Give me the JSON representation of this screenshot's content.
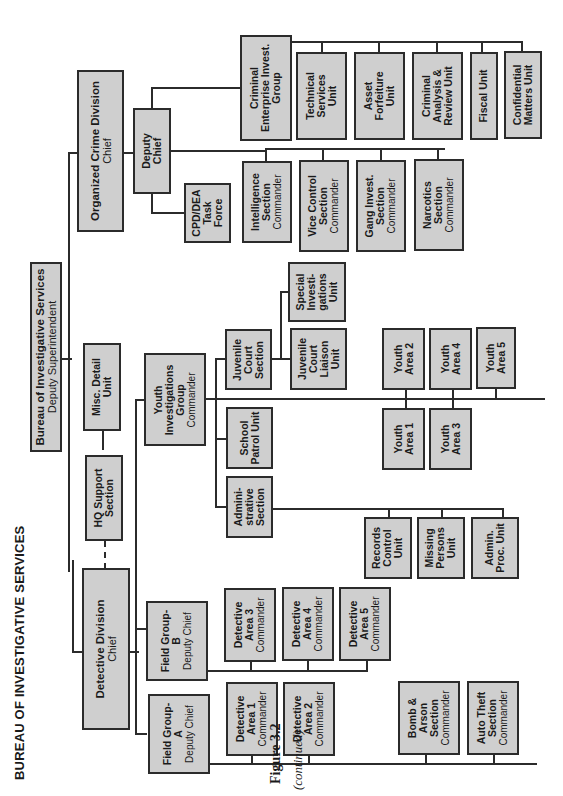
{
  "page": {
    "title": "BUREAU OF INVESTIGATIVE SERVICES",
    "figure_label": "Figure 3.2",
    "figure_note": "(continued)"
  },
  "org": {
    "root": {
      "name": "Bureau of Investigative Services",
      "role": "Deputy Superintendent"
    },
    "organized_crime": {
      "name": "Organized Crime Division",
      "role": "Chief"
    },
    "oc_deputy": {
      "name": "Deputy Chief"
    },
    "cpd_dea": {
      "name": "CPD/DEA Task Force"
    },
    "intelligence": {
      "name": "Intelligence Section",
      "role": "Commander"
    },
    "vice": {
      "name": "Vice Control Section",
      "role": "Commander"
    },
    "gang": {
      "name": "Gang Invest. Section",
      "role": "Commander"
    },
    "narcotics": {
      "name": "Narcotics Section",
      "role": "Commander"
    },
    "criminal_enterprise": {
      "name": "Criminal Enterprise Invest. Group"
    },
    "technical": {
      "name": "Technical Services Unit"
    },
    "asset": {
      "name": "Asset Forfeiture Unit"
    },
    "analysis": {
      "name": "Criminal Analysis & Review Unit"
    },
    "fiscal": {
      "name": "Fiscal Unit"
    },
    "confidential": {
      "name": "Confidential Matters Unit"
    },
    "misc": {
      "name": "Misc. Detail Unit"
    },
    "hq": {
      "name": "HQ Support Section"
    },
    "detective": {
      "name": "Detective Division",
      "role": "Chief"
    },
    "youth_group": {
      "name": "Youth Investigations Group",
      "role": "Commander"
    },
    "juvenile_court": {
      "name": "Juvenile Court Section"
    },
    "special_inv": {
      "name": "Special Investi- gations Unit"
    },
    "juv_liaison": {
      "name": "Juvenile Court Liaison Unit"
    },
    "school_patrol": {
      "name": "School Patrol Unit"
    },
    "admin_section": {
      "name": "Admini- strative Section"
    },
    "records": {
      "name": "Records Control Unit"
    },
    "missing": {
      "name": "Missing Persons Unit"
    },
    "admin_proc": {
      "name": "Admin. Proc. Unit"
    },
    "youth_areas": [
      "Youth Area 1",
      "Youth Area 2",
      "Youth Area 3",
      "Youth Area 4",
      "Youth Area 5"
    ],
    "field_a": {
      "name": "Field Group- A",
      "role": "Deputy Chief"
    },
    "field_b": {
      "name": "Field Group- B",
      "role": "Deputy Chief"
    },
    "det_areas": [
      {
        "name": "Detective Area 1",
        "role": "Commander"
      },
      {
        "name": "Detective Area 2",
        "role": "Commander"
      },
      {
        "name": "Detective Area 3",
        "role": "Commander"
      },
      {
        "name": "Detective Area 4",
        "role": "Commander"
      },
      {
        "name": "Detective Area 5",
        "role": "Commander"
      }
    ],
    "bomb": {
      "name": "Bomb & Arson Section",
      "role": "Commander"
    },
    "auto": {
      "name": "Auto Theft Section",
      "role": "Commander"
    }
  }
}
